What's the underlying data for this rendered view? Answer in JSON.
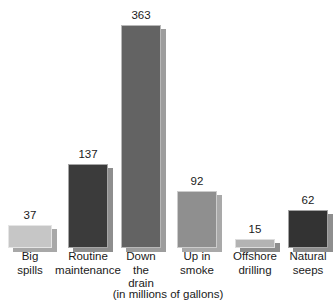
{
  "chart_data": {
    "type": "bar",
    "title": "",
    "subtitle": "",
    "caption": "(in millions of gallons)",
    "xlabel": "",
    "ylabel": "",
    "ylim": [
      0,
      363
    ],
    "grid": false,
    "legend": "none",
    "value_labels": true,
    "categories": [
      "Big spills",
      "Routine maintenance",
      "Down the drain",
      "Up in smoke",
      "Offshore drilling",
      "Natural seeps"
    ],
    "values": [
      37,
      137,
      363,
      92,
      15,
      62
    ],
    "bars": [
      {
        "label_lines": [
          "Big",
          "spills"
        ],
        "value": 37,
        "value_text": "37",
        "color": "#c6c6c6",
        "shadow_color": "#a8a8a8",
        "x": 8,
        "width": 44
      },
      {
        "label_lines": [
          "Routine",
          "maintenance"
        ],
        "value": 137,
        "value_text": "137",
        "color": "#3b3b3b",
        "shadow_color": "#8e8e8e",
        "x": 68,
        "width": 40
      },
      {
        "label_lines": [
          "Down",
          "the",
          "drain"
        ],
        "value": 363,
        "value_text": "363",
        "color": "#636363",
        "shadow_color": "#9d9d9d",
        "x": 121,
        "width": 40
      },
      {
        "label_lines": [
          "Up in",
          "smoke"
        ],
        "value": 92,
        "value_text": "92",
        "color": "#8f8f8f",
        "shadow_color": "#a9a9a9",
        "x": 177,
        "width": 40
      },
      {
        "label_lines": [
          "Offshore",
          "drilling"
        ],
        "value": 15,
        "value_text": "15",
        "color": "#b3b3b3",
        "shadow_color": "#8d8d8d",
        "x": 235,
        "width": 40
      },
      {
        "label_lines": [
          "Natural",
          "seeps"
        ],
        "value": 62,
        "value_text": "62",
        "color": "#333333",
        "shadow_color": "#8e8e8e",
        "x": 288,
        "width": 40
      }
    ]
  }
}
